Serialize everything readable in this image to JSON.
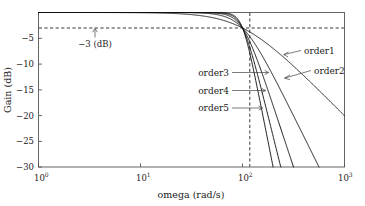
{
  "chart_data": {
    "type": "line",
    "title": "",
    "xlabel": "omega  (rad/s)",
    "ylabel": "Gain  (dB)",
    "xscale": "log",
    "xlim": [
      1,
      1000
    ],
    "ylim": [
      -30,
      0
    ],
    "grid": false,
    "legend_position": "inline-annotations",
    "xticks": [
      {
        "value": 1,
        "base": "10",
        "exp": "0"
      },
      {
        "value": 10,
        "base": "10",
        "exp": "1"
      },
      {
        "value": 100,
        "base": "10",
        "exp": "2"
      },
      {
        "value": 1000,
        "base": "10",
        "exp": "3"
      }
    ],
    "yticks": [
      {
        "value": -5,
        "label": "−5"
      },
      {
        "value": -10,
        "label": "−10"
      },
      {
        "value": -15,
        "label": "−15"
      },
      {
        "value": -20,
        "label": "−20"
      },
      {
        "value": -25,
        "label": "−25"
      },
      {
        "value": -30,
        "label": "−30"
      }
    ],
    "annotations": [
      {
        "name": "cutoff-gain-annotation",
        "label": "−3 (dB)",
        "points_to": {
          "x": 3.0,
          "y": -3.0
        }
      },
      {
        "name": "order1-annotation",
        "label": "order1",
        "points_to": {
          "x": 300,
          "y": -10.5
        }
      },
      {
        "name": "order2-annotation",
        "label": "order2",
        "points_to": {
          "x": 230,
          "y": -14.5
        }
      },
      {
        "name": "order3-annotation",
        "label": "order3",
        "points_to": {
          "x": 145,
          "y": -11.2
        }
      },
      {
        "name": "order4-annotation",
        "label": "order4",
        "points_to": {
          "x": 140,
          "y": -14.8
        }
      },
      {
        "name": "order5-annotation",
        "label": "order5",
        "points_to": {
          "x": 132,
          "y": -18.2
        }
      }
    ],
    "reference_lines": [
      {
        "name": "minus-3db-line",
        "orientation": "horizontal",
        "value": -3,
        "style": "dashed"
      },
      {
        "name": "cutoff-frequency-line",
        "orientation": "vertical",
        "value": 100,
        "style": "dashed"
      }
    ],
    "cutoff_frequency": 100,
    "series": [
      {
        "name": "order1",
        "order": 1,
        "label": "order1",
        "color": "#111111"
      },
      {
        "name": "order2",
        "order": 2,
        "label": "order2",
        "color": "#111111"
      },
      {
        "name": "order3",
        "order": 3,
        "label": "order3",
        "color": "#111111"
      },
      {
        "name": "order4",
        "order": 4,
        "label": "order4",
        "color": "#111111"
      },
      {
        "name": "order5",
        "order": 5,
        "label": "order5",
        "color": "#111111"
      }
    ],
    "x": [
      1,
      1.58,
      2.51,
      3.98,
      6.31,
      10,
      15.8,
      25.1,
      39.8,
      63.1,
      100,
      158,
      251,
      398,
      631,
      1000
    ],
    "series_values": {
      "order1": [
        -0.00043,
        -0.00109,
        -0.00273,
        -0.00686,
        -0.0172,
        -0.0432,
        -0.1077,
        -0.265,
        -0.6354,
        -1.4352,
        -3.0103,
        -5.4935,
        -8.588,
        -12.0456,
        -15.6873,
        -19.4234
      ],
      "order2": [
        -9e-07,
        -5.9e-06,
        -3.72e-05,
        -0.000235,
        -0.00148,
        -0.00934,
        -0.0586,
        -0.3582,
        -2.0218,
        -5.959,
        -3.0103,
        -10.985,
        -17.176,
        -24.091,
        -31.374,
        -38.847
      ],
      "order3": [
        -0.0,
        -0.0,
        -5e-07,
        -8.1e-06,
        -0.000128,
        -0.002024,
        -0.03194,
        -0.4937,
        -3.0103,
        -10.987,
        -3.0103,
        -16.478,
        -25.764,
        -36.137,
        -47.062,
        -58.27
      ],
      "order4": [
        -0.0,
        -0.0,
        -0.0,
        -3e-07,
        -1.11e-05,
        -0.000439,
        -0.01739,
        -0.6766,
        -4.0117,
        -14.652,
        -3.0103,
        -21.97,
        -34.352,
        -48.182,
        -62.749,
        -77.694
      ],
      "order5": [
        -0.0,
        -0.0,
        -0.0,
        -0.0,
        -1e-06,
        -9.52e-05,
        -0.009466,
        -0.9155,
        -5.0118,
        -18.317,
        -3.0103,
        -27.463,
        -42.94,
        -60.228,
        -78.436,
        -97.117
      ]
    },
    "note": "Butterworth low-pass magnitude response; all orders pass through -3 dB at omega = 100 rad/s"
  }
}
